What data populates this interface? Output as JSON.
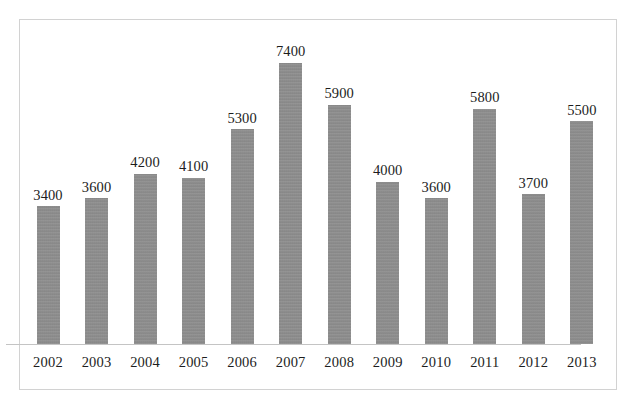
{
  "chart_data": {
    "type": "bar",
    "title": "",
    "subtitle": "",
    "xlabel": "",
    "ylabel": "",
    "categories": [
      "2002",
      "2003",
      "2004",
      "2005",
      "2006",
      "2007",
      "2008",
      "2009",
      "2010",
      "2011",
      "2012",
      "2013"
    ],
    "values": [
      3400,
      3600,
      4200,
      4100,
      5300,
      7400,
      5900,
      4000,
      3600,
      5800,
      3700,
      5500
    ],
    "data_labels": [
      "3400",
      "3600",
      "4200",
      "4100",
      "5300",
      "7400",
      "5900",
      "4000",
      "3600",
      "5800",
      "3700",
      "5500"
    ],
    "ylim": [
      0,
      7400
    ],
    "grid": false,
    "legend": null,
    "axis_tick_labels_shown": true,
    "value_labels_shown": true
  },
  "style": {
    "bar_color": "#8c8c8c",
    "background_color": "#ffffff",
    "frame_border_color": "#d2d2d2",
    "axis_line_color": "#c4c4c4",
    "text_color": "#1d1d1d"
  }
}
